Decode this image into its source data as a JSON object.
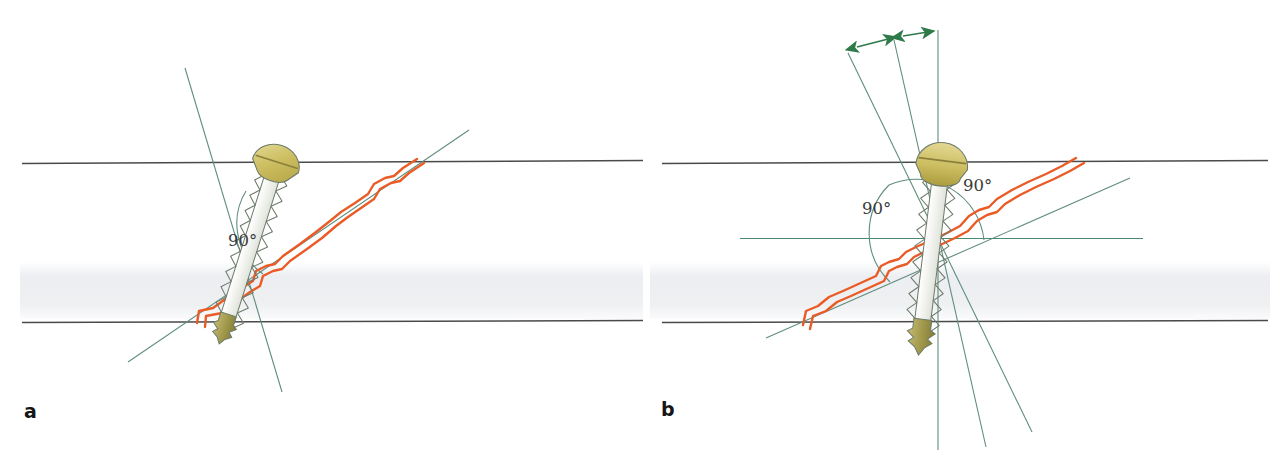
{
  "figure": {
    "width": 1286,
    "height": 457,
    "background": "#ffffff"
  },
  "colors": {
    "cortex_line": "#4a4a4a",
    "medullary_band": "#f1f1f3",
    "guide_line": "#5f8d7e",
    "reference_line": "#4b8a72",
    "fracture_line": "#ea5b26",
    "screw_outline": "#6d7b6a",
    "screw_head_fill": "#c8b95a",
    "screw_head_fill_light": "#ddd289",
    "screw_tip_fill": "#a9a04e",
    "arrow_green": "#2f7a4a",
    "label_text": "#3b3b3b",
    "panel_letter": "#161616"
  },
  "panels": [
    {
      "id": "a",
      "letter": "a",
      "description": "Screw inserted perpendicular to the fracture plane",
      "angle_labels": [
        {
          "text": "90°",
          "x": 228,
          "y": 246
        }
      ],
      "arrows": []
    },
    {
      "id": "b",
      "letter": "b",
      "description": "Screw inserted perpendicular to the bone long axis with angular deviation arrows",
      "angle_labels": [
        {
          "text": "90°",
          "x": 862,
          "y": 214
        },
        {
          "text": "90°",
          "x": 963,
          "y": 191
        }
      ],
      "arrows": [
        {
          "name": "deviation-arrow-left",
          "x1": 857,
          "y1": 47,
          "x2": 896,
          "y2": 37
        },
        {
          "name": "deviation-arrow-right",
          "x1": 903,
          "y1": 36,
          "x2": 934,
          "y2": 32
        }
      ]
    }
  ],
  "anatomy": {
    "upper_cortex_y": 163,
    "lower_cortex_y": 322,
    "medullary_top_y": 262,
    "medullary_bottom_y": 318,
    "cortex_left_x": 20,
    "cortex_right_x": 1270
  },
  "legend": {
    "fracture_label": "fracture line",
    "screw_label": "cortical lag screw",
    "guide_label": "axis guide line"
  }
}
